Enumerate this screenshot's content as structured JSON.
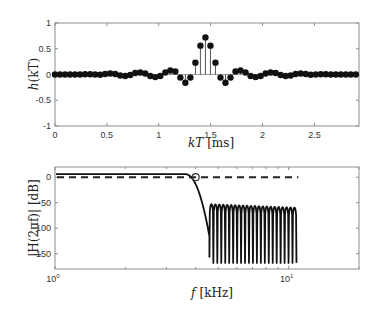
{
  "chart_data": [
    {
      "type": "stem",
      "title": "",
      "xlabel": "kT [ms]",
      "ylabel": "h(kT)",
      "xlim": [
        0,
        2.93
      ],
      "ylim": [
        -1,
        1
      ],
      "xticks": [
        0,
        0.5,
        1,
        1.5,
        2,
        2.5
      ],
      "xtick_labels": [
        "0",
        "0.5",
        "1",
        "1.5",
        "2",
        "2.5"
      ],
      "yticks": [
        1,
        0.5,
        0,
        -0.5,
        -1
      ],
      "ytick_labels": [
        "1",
        "0.5",
        "0",
        "-0.5",
        "-1"
      ],
      "grid": false,
      "sample_period_ms": 0.04833,
      "k": [
        0,
        1,
        2,
        3,
        4,
        5,
        6,
        7,
        8,
        9,
        10,
        11,
        12,
        13,
        14,
        15,
        16,
        17,
        18,
        19,
        20,
        21,
        22,
        23,
        24,
        25,
        26,
        27,
        28,
        29,
        30,
        31,
        32,
        33,
        34,
        35,
        36,
        37,
        38,
        39,
        40,
        41,
        42,
        43,
        44,
        45,
        46,
        47,
        48,
        49,
        50,
        51,
        52,
        53,
        54,
        55,
        56,
        57,
        58,
        59,
        60
      ],
      "values": [
        0,
        0,
        0,
        0,
        0,
        0,
        0.005,
        0.005,
        0,
        -0.005,
        0.01,
        0.02,
        0.01,
        -0.02,
        -0.03,
        -0.01,
        0.03,
        0.04,
        0.02,
        -0.03,
        -0.05,
        -0.03,
        0.04,
        0.08,
        0.06,
        -0.06,
        -0.16,
        -0.06,
        0.23,
        0.56,
        0.72,
        0.56,
        0.23,
        -0.06,
        -0.16,
        -0.06,
        0.06,
        0.08,
        0.04,
        -0.03,
        -0.05,
        -0.03,
        0.02,
        0.04,
        0.03,
        -0.01,
        -0.03,
        -0.02,
        0.01,
        0.02,
        0.01,
        -0.005,
        0,
        0.005,
        0.005,
        0,
        0,
        0,
        0,
        0,
        0
      ]
    },
    {
      "type": "line",
      "title": "",
      "xlabel": "f [kHz]",
      "ylabel": "|H(2πf)| [dB]",
      "xscale": "log",
      "xlim": [
        1,
        20
      ],
      "ylim": [
        -180,
        20
      ],
      "xticks": [
        1,
        10
      ],
      "xtick_labels": [
        "10^0",
        "10^1"
      ],
      "yticks": [
        0,
        -50,
        -100,
        -150
      ],
      "ytick_labels": [
        "0",
        "-50",
        "-100",
        "-150"
      ],
      "grid": false,
      "series": [
        {
          "name": "magnitude response",
          "style": "solid",
          "passband_gain_db": 6,
          "passband_end_khz": 3.6,
          "cutoff_khz": 4.0,
          "first_null_khz": 4.58,
          "first_null_db": -156,
          "stopband_end_khz": 10.8,
          "sidelobe_peak_db_start": -53,
          "sidelobe_peak_db_end": -60,
          "null_depth_db": -168,
          "num_nulls": 22
        },
        {
          "name": "ideal reference",
          "style": "dashed",
          "x": [
            1,
            11
          ],
          "values": [
            0,
            0
          ]
        }
      ],
      "annotations": [
        {
          "type": "circle-marker",
          "x": 4.0,
          "y": 0
        }
      ]
    }
  ],
  "labels": {
    "top_ylabel_main": "h",
    "top_ylabel_arg": "(kT)",
    "top_xlabel_var": "kT",
    "top_xlabel_unit": "[ms]",
    "bottom_ylabel": "|H(2πf)| [dB]",
    "bottom_xlabel_var": "f",
    "bottom_xlabel_unit": "[kHz]",
    "bottom_xtick_base": "10",
    "bottom_xtick_exp0": "0",
    "bottom_xtick_exp1": "1"
  }
}
